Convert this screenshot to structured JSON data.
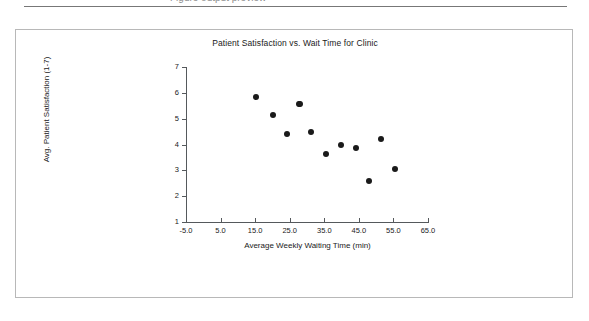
{
  "page": {
    "top_partial_text": "Figure output preview",
    "rule": "horizontal-rule"
  },
  "chart_data": {
    "type": "scatter",
    "title": "Patient Satisfaction vs. Wait Time for Clinic",
    "xlabel": "Average Weekly Waiting Time (min)",
    "ylabel": "Avg. Patient Satisfaction (1-7)",
    "xlim": [
      -5.0,
      65.0
    ],
    "ylim": [
      1,
      7
    ],
    "grid": false,
    "legend": null,
    "x_ticks": [
      "-5.0",
      "5.0",
      "15.0",
      "25.0",
      "35.0",
      "45.0",
      "55.0",
      "65.0"
    ],
    "x_tick_values": [
      -5.0,
      5.0,
      15.0,
      25.0,
      35.0,
      45.0,
      55.0,
      65.0
    ],
    "y_ticks": [
      "1",
      "2",
      "3",
      "4",
      "5",
      "6",
      "7"
    ],
    "y_tick_values": [
      1,
      2,
      3,
      4,
      5,
      6,
      7
    ],
    "marker_color": "#1a1a1a",
    "points": [
      {
        "x": 15.3,
        "y": 5.85
      },
      {
        "x": 20.2,
        "y": 5.15
      },
      {
        "x": 24.3,
        "y": 4.4
      },
      {
        "x": 27.6,
        "y": 5.55
      },
      {
        "x": 31.2,
        "y": 4.5
      },
      {
        "x": 35.6,
        "y": 3.65
      },
      {
        "x": 39.9,
        "y": 4.0
      },
      {
        "x": 44.2,
        "y": 3.85
      },
      {
        "x": 47.8,
        "y": 2.6
      },
      {
        "x": 51.5,
        "y": 4.2
      },
      {
        "x": 55.5,
        "y": 3.05
      },
      {
        "x": 28.0,
        "y": 5.55
      }
    ]
  }
}
